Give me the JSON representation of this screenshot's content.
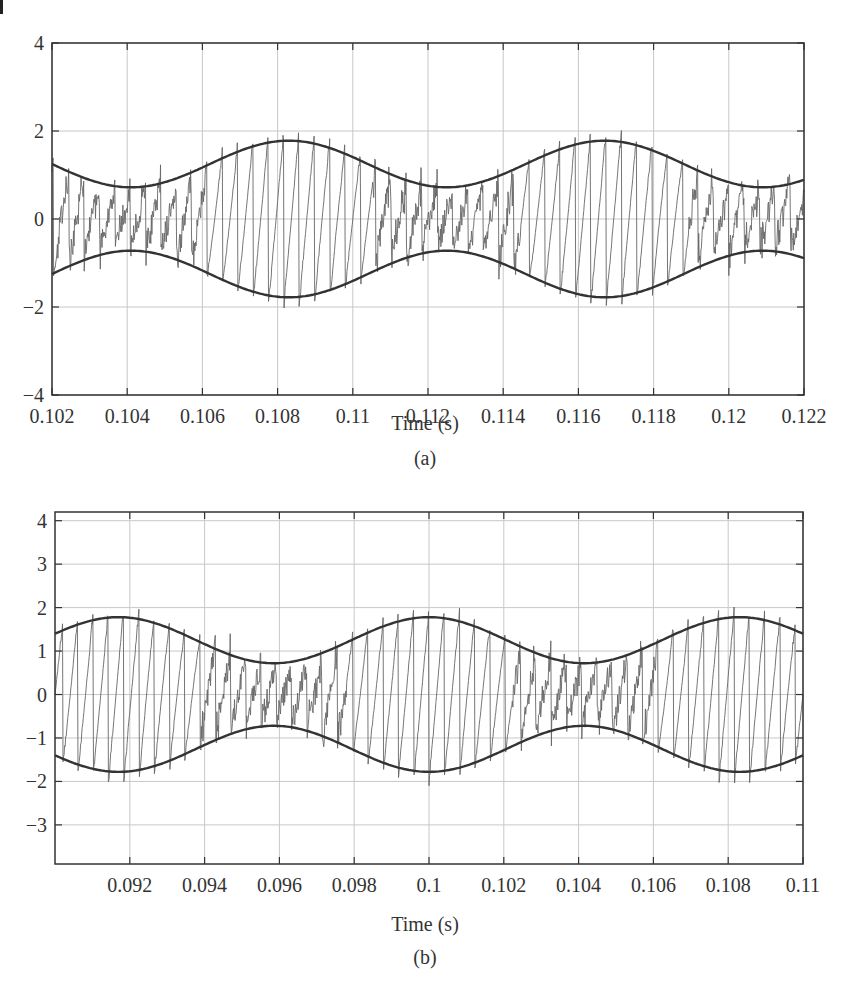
{
  "figure": {
    "panels": [
      {
        "id": "a",
        "caption": "(a)",
        "xlabel": "Time (s)"
      },
      {
        "id": "b",
        "caption": "(b)",
        "xlabel": "Time (s)"
      }
    ]
  },
  "colors": {
    "axis": "#333333",
    "grid": "#c8c8c8",
    "signal": "#666666",
    "envelope": "#333333"
  },
  "chart_data": [
    {
      "type": "line",
      "title": "",
      "caption": "(a)",
      "xlabel": "Time (s)",
      "ylabel": "",
      "xlim": [
        0.102,
        0.122
      ],
      "ylim": [
        -4,
        4
      ],
      "grid": true,
      "xticks": [
        0.102,
        0.104,
        0.106,
        0.108,
        0.11,
        0.112,
        0.114,
        0.116,
        0.118,
        0.12,
        0.122
      ],
      "xtick_labels": [
        "0.102",
        "0.104",
        "0.106",
        "0.108",
        "0.11",
        "0.112",
        "0.114",
        "0.116",
        "0.118",
        "0.12",
        "0.122"
      ],
      "yticks": [
        -4,
        -2,
        0,
        2,
        4
      ],
      "ytick_labels": [
        "−4",
        "−2",
        "0",
        "2",
        "4"
      ],
      "series": [
        {
          "name": "upper envelope",
          "style": "thick-dark",
          "x": [
            0.102,
            0.104,
            0.1063,
            0.1083,
            0.1104,
            0.1125,
            0.1146,
            0.1167,
            0.1188,
            0.1209,
            0.122
          ],
          "y": [
            1.27,
            0.73,
            1.25,
            1.78,
            1.25,
            0.72,
            1.25,
            1.78,
            1.25,
            0.72,
            0.9
          ]
        },
        {
          "name": "lower envelope",
          "style": "thick-dark",
          "x": [
            0.102,
            0.104,
            0.1063,
            0.1083,
            0.1104,
            0.1125,
            0.1146,
            0.1167,
            0.1188,
            0.1209,
            0.122
          ],
          "y": [
            -1.27,
            -0.73,
            -1.25,
            -1.78,
            -1.25,
            -0.72,
            -1.25,
            -1.78,
            -1.25,
            -0.72,
            -0.9
          ]
        },
        {
          "name": "signal",
          "style": "thin-gray",
          "description": "high-frequency oscillation (~2.5 kHz) filling envelope, peaks reaching about ±2.5; irregular/noisy where envelope is narrow",
          "peak_max": 2.55,
          "peak_min": -2.6
        }
      ],
      "envelope_model": {
        "center": 1.25,
        "amplitude": 0.53,
        "period": 0.0084,
        "t_max": 0.1083
      }
    },
    {
      "type": "line",
      "title": "",
      "caption": "(b)",
      "xlabel": "Time (s)",
      "ylabel": "",
      "xlim": [
        0.09,
        0.11
      ],
      "ylim": [
        -3.9,
        4.2
      ],
      "grid": true,
      "xticks": [
        0.092,
        0.094,
        0.096,
        0.098,
        0.1,
        0.102,
        0.104,
        0.106,
        0.108,
        0.11
      ],
      "xtick_labels": [
        "0.092",
        "0.094",
        "0.096",
        "0.098",
        "0.1",
        "0.102",
        "0.104",
        "0.106",
        "0.108",
        "0.11"
      ],
      "yticks": [
        -3,
        -2,
        -1,
        0,
        1,
        2,
        3,
        4
      ],
      "ytick_labels": [
        "−3",
        "−2",
        "−1",
        "0",
        "1",
        "2",
        "3",
        "4"
      ],
      "series": [
        {
          "name": "upper envelope",
          "style": "thick-dark",
          "x": [
            0.09,
            0.0917,
            0.0938,
            0.0958,
            0.0979,
            0.1,
            0.1021,
            0.1042,
            0.1063,
            0.1083,
            0.11
          ],
          "y": [
            1.43,
            1.78,
            1.25,
            0.72,
            1.25,
            1.78,
            1.25,
            0.72,
            1.25,
            1.78,
            1.4
          ]
        },
        {
          "name": "lower envelope",
          "style": "thick-dark",
          "x": [
            0.09,
            0.0917,
            0.0938,
            0.0958,
            0.0979,
            0.1,
            0.1021,
            0.1042,
            0.1063,
            0.1083,
            0.11
          ],
          "y": [
            -1.43,
            -1.78,
            -1.25,
            -0.72,
            -1.25,
            -1.78,
            -1.25,
            -0.72,
            -1.25,
            -1.78,
            -1.4
          ]
        },
        {
          "name": "signal",
          "style": "thin-gray",
          "description": "high-frequency oscillation (~2.5 kHz) filling envelope, peaks reaching about ±2.2; irregular small-amplitude noise near envelope minima",
          "peak_max": 2.15,
          "peak_min": -2.3
        }
      ],
      "envelope_model": {
        "center": 1.25,
        "amplitude": 0.53,
        "period": 0.0083,
        "t_max": 0.1
      }
    }
  ]
}
